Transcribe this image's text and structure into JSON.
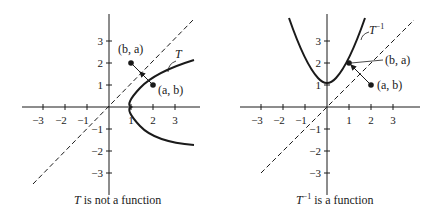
{
  "figures": [
    {
      "id": "left",
      "curve_label": "T",
      "point_ab_label": "(a, b)",
      "point_ba_label": "(b, a)",
      "caption_symbol": "T",
      "caption_sup": "",
      "caption_text": " is not a function",
      "x_ticks": [
        "−3",
        "−2",
        "−1",
        "1",
        "2",
        "3"
      ],
      "y_ticks": [
        "3",
        "2",
        "1",
        "−1",
        "−2",
        "−3"
      ]
    },
    {
      "id": "right",
      "curve_label": "T",
      "curve_label_sup": "−1",
      "point_ab_label": "(a, b)",
      "point_ba_label": "(b, a)",
      "caption_symbol": "T",
      "caption_sup": "−1",
      "caption_text": " is a function",
      "x_ticks": [
        "−3",
        "−2",
        "−1",
        "1",
        "2",
        "3"
      ],
      "y_ticks": [
        "3",
        "2",
        "1",
        "−1",
        "−2",
        "−3"
      ]
    }
  ],
  "colors": {
    "ink": "#1a1a1a",
    "background": "#ffffff"
  }
}
